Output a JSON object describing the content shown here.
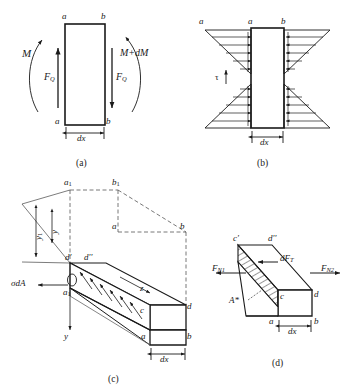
{
  "figure": {
    "stroke_color": "#1a1a1a",
    "hatch_color": "#333333"
  },
  "panels": [
    {
      "id": "a",
      "caption": "(a)",
      "labels": {
        "corner_top_left": "a",
        "corner_top_right": "b",
        "corner_bottom_left": "a",
        "corner_bottom_right": "b",
        "moment_left": "M",
        "moment_right": "M+dM",
        "shear_left": "F",
        "shear_left_sub": "Q",
        "shear_right": "F",
        "shear_right_sub": "Q",
        "width_dim": "dx"
      }
    },
    {
      "id": "b",
      "caption": "(b)",
      "labels": {
        "outer_left": "a",
        "corner_top_left": "a",
        "corner_top_right": "b",
        "shear_stress": "τ",
        "width_dim": "dx"
      }
    },
    {
      "id": "c",
      "caption": "(c)",
      "labels": {
        "top_rear_left": "a",
        "top_rear_left_sub": "1",
        "top_rear_right": "b",
        "top_rear_right_sub": "1",
        "mid_right_a": "a",
        "mid_right_b": "b",
        "dim_y1": "y",
        "dim_y1_sub": "1",
        "dim_y": "y",
        "face_top_left": "d'",
        "face_top_right": "d''",
        "face_left": "a",
        "face_left_sub": "1",
        "stress_force": "σdA",
        "axis_z": "z",
        "axis_y": "y",
        "near_c": "c",
        "near_d": "d",
        "near_a": "a",
        "near_b": "b",
        "width_dim": "dx"
      }
    },
    {
      "id": "d",
      "caption": "(d)",
      "labels": {
        "top_left": "c'",
        "top_right": "d''",
        "force_left": "F",
        "force_left_sub": "N1",
        "force_right": "F",
        "force_right_sub": "N2",
        "shear_force": "dF",
        "shear_force_sub": "T",
        "area": "A*",
        "near_c": "c",
        "near_d": "d",
        "near_a": "a",
        "near_b": "b",
        "width_dim": "dx"
      }
    }
  ]
}
